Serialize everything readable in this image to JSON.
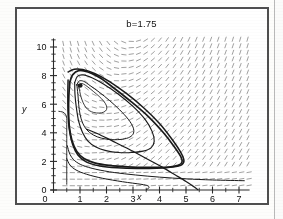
{
  "figure": {
    "title": "b=1.75",
    "frame": true,
    "background": "#ffffff",
    "border_color": "#4f4f4f"
  },
  "chart_data": {
    "type": "line",
    "subtype": "phase-portrait-with-direction-field",
    "title": "b=1.75",
    "xlabel": "x",
    "ylabel": "y",
    "xlim": [
      0,
      7.4
    ],
    "ylim": [
      0,
      10.6
    ],
    "xticks": [
      0,
      1,
      2,
      3,
      4,
      5,
      6,
      7
    ],
    "yticks": [
      0,
      2,
      4,
      6,
      8,
      10
    ],
    "xtick_labels": [
      "0",
      "1",
      "2",
      "3",
      "4",
      "5",
      "6",
      "7"
    ],
    "ytick_labels": [
      "0",
      "2",
      "4",
      "6",
      "8",
      "10"
    ],
    "minor_ticks": true,
    "minor_tick_step_x": 0.5,
    "minor_tick_step_y": 0.5,
    "grid": false,
    "legend": null,
    "line_color": "#1a1a1a",
    "field_color": "#8e8e8e",
    "fixed_points": [
      {
        "name": "unstable-spiral",
        "x": 1.0,
        "y": 7.3,
        "marker": "filled-dot"
      }
    ],
    "annotations": [],
    "series": [
      {
        "name": "limit-cycle",
        "closed": true,
        "points": [
          [
            0.62,
            7.55
          ],
          [
            0.72,
            8.05
          ],
          [
            0.95,
            8.35
          ],
          [
            1.3,
            8.25
          ],
          [
            1.75,
            7.85
          ],
          [
            2.3,
            7.1
          ],
          [
            2.95,
            6.15
          ],
          [
            3.6,
            5.1
          ],
          [
            4.15,
            4.0
          ],
          [
            4.55,
            3.05
          ],
          [
            4.8,
            2.35
          ],
          [
            4.85,
            1.95
          ],
          [
            4.7,
            1.72
          ],
          [
            4.3,
            1.6
          ],
          [
            3.6,
            1.58
          ],
          [
            2.8,
            1.62
          ],
          [
            2.1,
            1.72
          ],
          [
            1.55,
            1.9
          ],
          [
            1.15,
            2.2
          ],
          [
            0.88,
            2.7
          ],
          [
            0.7,
            3.45
          ],
          [
            0.6,
            4.4
          ],
          [
            0.57,
            5.5
          ],
          [
            0.58,
            6.6
          ],
          [
            0.62,
            7.55
          ]
        ]
      },
      {
        "name": "outward-spiral-inner-1",
        "closed": true,
        "points": [
          [
            0.88,
            7.35
          ],
          [
            0.97,
            7.62
          ],
          [
            1.14,
            7.6
          ],
          [
            1.38,
            7.3
          ],
          [
            1.72,
            6.85
          ],
          [
            2.12,
            6.25
          ],
          [
            2.5,
            5.6
          ],
          [
            2.82,
            4.95
          ],
          [
            3.0,
            4.4
          ],
          [
            3.02,
            3.98
          ],
          [
            2.88,
            3.7
          ],
          [
            2.6,
            3.55
          ],
          [
            2.2,
            3.52
          ],
          [
            1.82,
            3.62
          ],
          [
            1.5,
            3.85
          ],
          [
            1.26,
            4.2
          ],
          [
            1.1,
            4.68
          ],
          [
            1.0,
            5.3
          ],
          [
            0.95,
            6.0
          ],
          [
            0.92,
            6.7
          ],
          [
            0.88,
            7.35
          ]
        ]
      },
      {
        "name": "outward-spiral-inner-2",
        "closed": true,
        "points": [
          [
            0.8,
            7.5
          ],
          [
            0.9,
            7.95
          ],
          [
            1.12,
            8.05
          ],
          [
            1.45,
            7.85
          ],
          [
            1.9,
            7.4
          ],
          [
            2.45,
            6.7
          ],
          [
            3.0,
            5.85
          ],
          [
            3.45,
            4.95
          ],
          [
            3.72,
            4.1
          ],
          [
            3.8,
            3.4
          ],
          [
            3.68,
            2.95
          ],
          [
            3.38,
            2.72
          ],
          [
            2.95,
            2.62
          ],
          [
            2.45,
            2.62
          ],
          [
            1.98,
            2.75
          ],
          [
            1.6,
            3.0
          ],
          [
            1.3,
            3.42
          ],
          [
            1.1,
            4.0
          ],
          [
            0.95,
            4.8
          ],
          [
            0.86,
            5.8
          ],
          [
            0.81,
            6.7
          ],
          [
            0.8,
            7.5
          ]
        ]
      },
      {
        "name": "outward-spiral-inner-3",
        "closed": true,
        "points": [
          [
            0.95,
            7.3
          ],
          [
            1.02,
            7.45
          ],
          [
            1.14,
            7.4
          ],
          [
            1.3,
            7.2
          ],
          [
            1.5,
            6.9
          ],
          [
            1.72,
            6.55
          ],
          [
            1.9,
            6.2
          ],
          [
            2.0,
            5.88
          ],
          [
            2.0,
            5.62
          ],
          [
            1.9,
            5.45
          ],
          [
            1.72,
            5.38
          ],
          [
            1.52,
            5.42
          ],
          [
            1.35,
            5.55
          ],
          [
            1.22,
            5.78
          ],
          [
            1.12,
            6.1
          ],
          [
            1.04,
            6.5
          ],
          [
            0.99,
            6.9
          ],
          [
            0.95,
            7.3
          ]
        ]
      },
      {
        "name": "outer-approach-orbit",
        "closed": false,
        "points": [
          [
            0.55,
            8.25
          ],
          [
            0.78,
            8.45
          ],
          [
            1.1,
            8.42
          ],
          [
            1.55,
            8.15
          ],
          [
            2.1,
            7.6
          ],
          [
            2.75,
            6.75
          ],
          [
            3.4,
            5.75
          ],
          [
            4.0,
            4.65
          ],
          [
            4.45,
            3.6
          ],
          [
            4.78,
            2.7
          ],
          [
            4.92,
            2.1
          ],
          [
            4.85,
            1.78
          ],
          [
            4.5,
            1.6
          ],
          [
            3.9,
            1.52
          ],
          [
            3.15,
            1.5
          ],
          [
            2.4,
            1.55
          ],
          [
            1.75,
            1.68
          ],
          [
            1.25,
            1.95
          ],
          [
            0.92,
            2.45
          ],
          [
            0.72,
            3.2
          ],
          [
            0.6,
            4.2
          ],
          [
            0.55,
            5.4
          ],
          [
            0.54,
            6.6
          ],
          [
            0.55,
            7.7
          ]
        ]
      },
      {
        "name": "incoming-trajectory-low-1",
        "closed": false,
        "points": [
          [
            0.52,
            3.1
          ],
          [
            0.62,
            2.5
          ],
          [
            0.8,
            2.05
          ],
          [
            1.1,
            1.72
          ],
          [
            1.6,
            1.45
          ],
          [
            2.3,
            1.22
          ],
          [
            3.1,
            1.05
          ],
          [
            4.0,
            0.9
          ],
          [
            5.0,
            0.78
          ],
          [
            6.0,
            0.7
          ],
          [
            7.2,
            0.65
          ]
        ]
      },
      {
        "name": "incoming-trajectory-low-2",
        "closed": false,
        "points": [
          [
            0.5,
            2.2
          ],
          [
            0.62,
            1.75
          ],
          [
            0.85,
            1.4
          ],
          [
            1.25,
            1.1
          ],
          [
            1.85,
            0.82
          ],
          [
            2.6,
            0.58
          ],
          [
            3.3,
            0.4
          ],
          [
            3.55,
            0.3
          ],
          [
            3.6,
            0.15
          ],
          [
            3.5,
            0.02
          ]
        ]
      },
      {
        "name": "outgoing-trajectory-to-axis",
        "closed": false,
        "points": [
          [
            1.25,
            4.25
          ],
          [
            1.65,
            3.95
          ],
          [
            2.2,
            3.45
          ],
          [
            2.85,
            2.85
          ],
          [
            3.5,
            2.2
          ],
          [
            4.1,
            1.6
          ],
          [
            4.6,
            1.05
          ],
          [
            5.0,
            0.6
          ],
          [
            5.3,
            0.22
          ],
          [
            5.45,
            0.02
          ]
        ]
      },
      {
        "name": "left-boundary-orbit",
        "closed": false,
        "points": [
          [
            0.2,
            5.5
          ],
          [
            0.35,
            5.45
          ],
          [
            0.45,
            5.3
          ],
          [
            0.5,
            5.0
          ],
          [
            0.5,
            4.4
          ],
          [
            0.5,
            3.6
          ],
          [
            0.5,
            2.8
          ],
          [
            0.5,
            2.0
          ],
          [
            0.5,
            1.2
          ],
          [
            0.5,
            0.4
          ]
        ]
      }
    ],
    "direction_field": {
      "description": "grid of short dash segments indicating flow direction",
      "x_range": [
        0.35,
        7.3
      ],
      "y_range": [
        0.3,
        10.4
      ],
      "nx": 26,
      "ny": 23,
      "color": "#909090"
    }
  }
}
